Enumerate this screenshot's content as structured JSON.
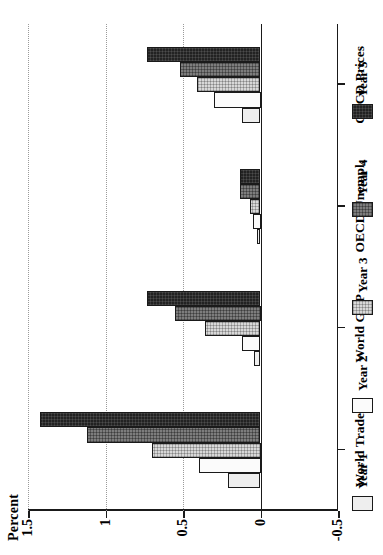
{
  "chart_data": {
    "type": "bar",
    "title": "",
    "ylabel": "Percent",
    "xlabel": "",
    "orientation": "rotated-90-ccw",
    "categories": [
      "World Trade",
      "World GDP",
      "OECD Unempl.",
      "OECD Prices"
    ],
    "ylim": [
      -0.5,
      1.5
    ],
    "yticks": [
      1.5,
      1,
      0.5,
      0,
      -0.5
    ],
    "ytick_labels": [
      "1.5",
      "1",
      "0.5",
      "0",
      "-0.5"
    ],
    "grid": true,
    "gridlines_at": [
      1.5,
      1.0,
      0.5
    ],
    "legend_position": "bottom",
    "series": [
      {
        "name": "Year 1",
        "color": "#eeeeee",
        "values": [
          0.21,
          0.04,
          0.02,
          0.12
        ]
      },
      {
        "name": "Year 2",
        "color": "#fbfbfb",
        "values": [
          0.4,
          0.12,
          0.05,
          0.3
        ]
      },
      {
        "name": "Year 3",
        "color": "#d8d8d8",
        "values": [
          0.7,
          0.36,
          0.07,
          0.41
        ]
      },
      {
        "name": "Year 4",
        "color": "#7d7d7d",
        "values": [
          1.12,
          0.55,
          0.13,
          0.52
        ]
      },
      {
        "name": "Year 5",
        "color": "#222222",
        "values": [
          1.42,
          0.73,
          0.13,
          0.73
        ]
      }
    ]
  },
  "axis": {
    "value_axis_title": "Percent",
    "tick_labels": [
      "1.5",
      "1",
      "0.5",
      "0",
      "-0.5"
    ],
    "category_labels": [
      "World Trade",
      "World GDP",
      "OECD Unempl.",
      "OECD Prices"
    ]
  },
  "legend": {
    "items": [
      {
        "label": "Year 1",
        "swatch": "legend-swatch-year-1"
      },
      {
        "label": "Year 2",
        "swatch": "legend-swatch-year-2"
      },
      {
        "label": "Year 3",
        "swatch": "legend-swatch-year-3"
      },
      {
        "label": "Year 4",
        "swatch": "legend-swatch-year-4"
      },
      {
        "label": "Year 5",
        "swatch": "legend-swatch-year-5"
      }
    ]
  }
}
